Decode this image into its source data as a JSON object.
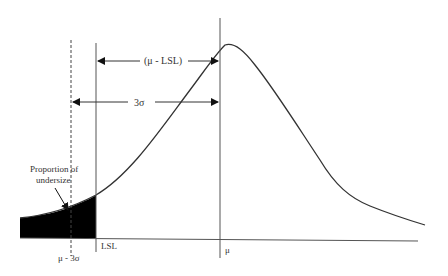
{
  "diagram": {
    "labels": {
      "mu_minus_lsl": "(μ - LSL)",
      "three_sigma": "3σ",
      "proportion_line1": "Proportion of",
      "proportion_line2": "undersize",
      "lsl": "LSL",
      "mu": "μ",
      "mu_minus_3sigma": "μ - 3σ"
    },
    "colors": {
      "line": "#444444",
      "fill": "#000000",
      "background": "#ffffff"
    }
  }
}
